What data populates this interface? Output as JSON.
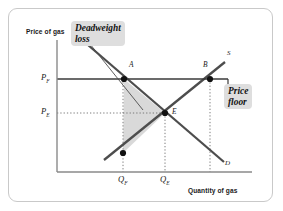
{
  "figure": {
    "type": "economics-supply-demand-diagram",
    "topic": "price floor with deadweight loss",
    "border_color": "#c9c9c9",
    "background": "#ffffff"
  },
  "axes": {
    "y_title": "Price of gas",
    "x_title": "Quantity of gas",
    "axis_color": "#8a8a8a",
    "origin": {
      "x": 57,
      "y": 172
    },
    "x_end": 252,
    "y_top": 40
  },
  "axis_values": {
    "y_ticks": [
      {
        "id": "price-floor",
        "label": "P",
        "sub": "F",
        "y": 79
      },
      {
        "id": "price-equilibrium",
        "label": "P",
        "sub": "E",
        "y": 113
      }
    ],
    "x_ticks": [
      {
        "id": "quantity-floor",
        "label": "Q",
        "sub": "F",
        "x": 123
      },
      {
        "id": "quantity-equilibrium",
        "label": "Q",
        "sub": "E",
        "x": 165
      }
    ]
  },
  "curves": {
    "supply": {
      "label": "S",
      "color": "#4d4d4d",
      "x1": 104,
      "y1": 160,
      "x2": 225,
      "y2": 62,
      "label_x": 227,
      "label_y": 53
    },
    "demand": {
      "label": "D",
      "color": "#4d4d4d",
      "x1": 88,
      "y1": 45,
      "x2": 224,
      "y2": 162,
      "label_x": 225,
      "label_y": 163
    }
  },
  "points": [
    {
      "id": "point-a",
      "label": "A",
      "x": 124,
      "y": 79,
      "label_x": 129,
      "label_y": 64
    },
    {
      "id": "point-b",
      "label": "B",
      "x": 210,
      "y": 79,
      "label_x": 204,
      "label_y": 64
    },
    {
      "id": "point-e",
      "label": "E",
      "x": 165,
      "y": 113,
      "label_x": 172,
      "label_y": 109
    },
    {
      "id": "point-supply-qf",
      "label": "",
      "x": 123,
      "y": 153,
      "label_x": 0,
      "label_y": 0
    }
  ],
  "price_floor_line": {
    "y": 79,
    "x_start": 57,
    "x_end": 228,
    "color": "#3a3a3a",
    "tick_bottom": 88
  },
  "deadweight_triangle": {
    "fill": "#d9d9d9",
    "vertices": [
      {
        "x": 124,
        "y": 79
      },
      {
        "x": 165,
        "y": 113
      },
      {
        "x": 123,
        "y": 153
      }
    ]
  },
  "callouts": {
    "deadweight": {
      "text": "Deadweight\nloss",
      "bg": "#dedede"
    },
    "price_floor": {
      "text": "Price\nfloor",
      "bg": "#dedede"
    }
  },
  "leader_line": {
    "x1": 90,
    "y1": 44,
    "x2": 143,
    "y2": 110,
    "color": "#4d4d4d"
  },
  "dotted_guides": {
    "color": "#6d6d6d",
    "vertical": [
      {
        "id": "guide-qf",
        "x": 123,
        "y_top": 79,
        "y_bottom": 172
      },
      {
        "id": "guide-qe",
        "x": 165,
        "y_top": 113,
        "y_bottom": 172
      },
      {
        "id": "guide-qb",
        "x": 210,
        "y_top": 79,
        "y_bottom": 172
      }
    ],
    "horizontal": [
      {
        "id": "guide-pe",
        "y": 113,
        "x_left": 57,
        "x_right": 165
      }
    ]
  }
}
